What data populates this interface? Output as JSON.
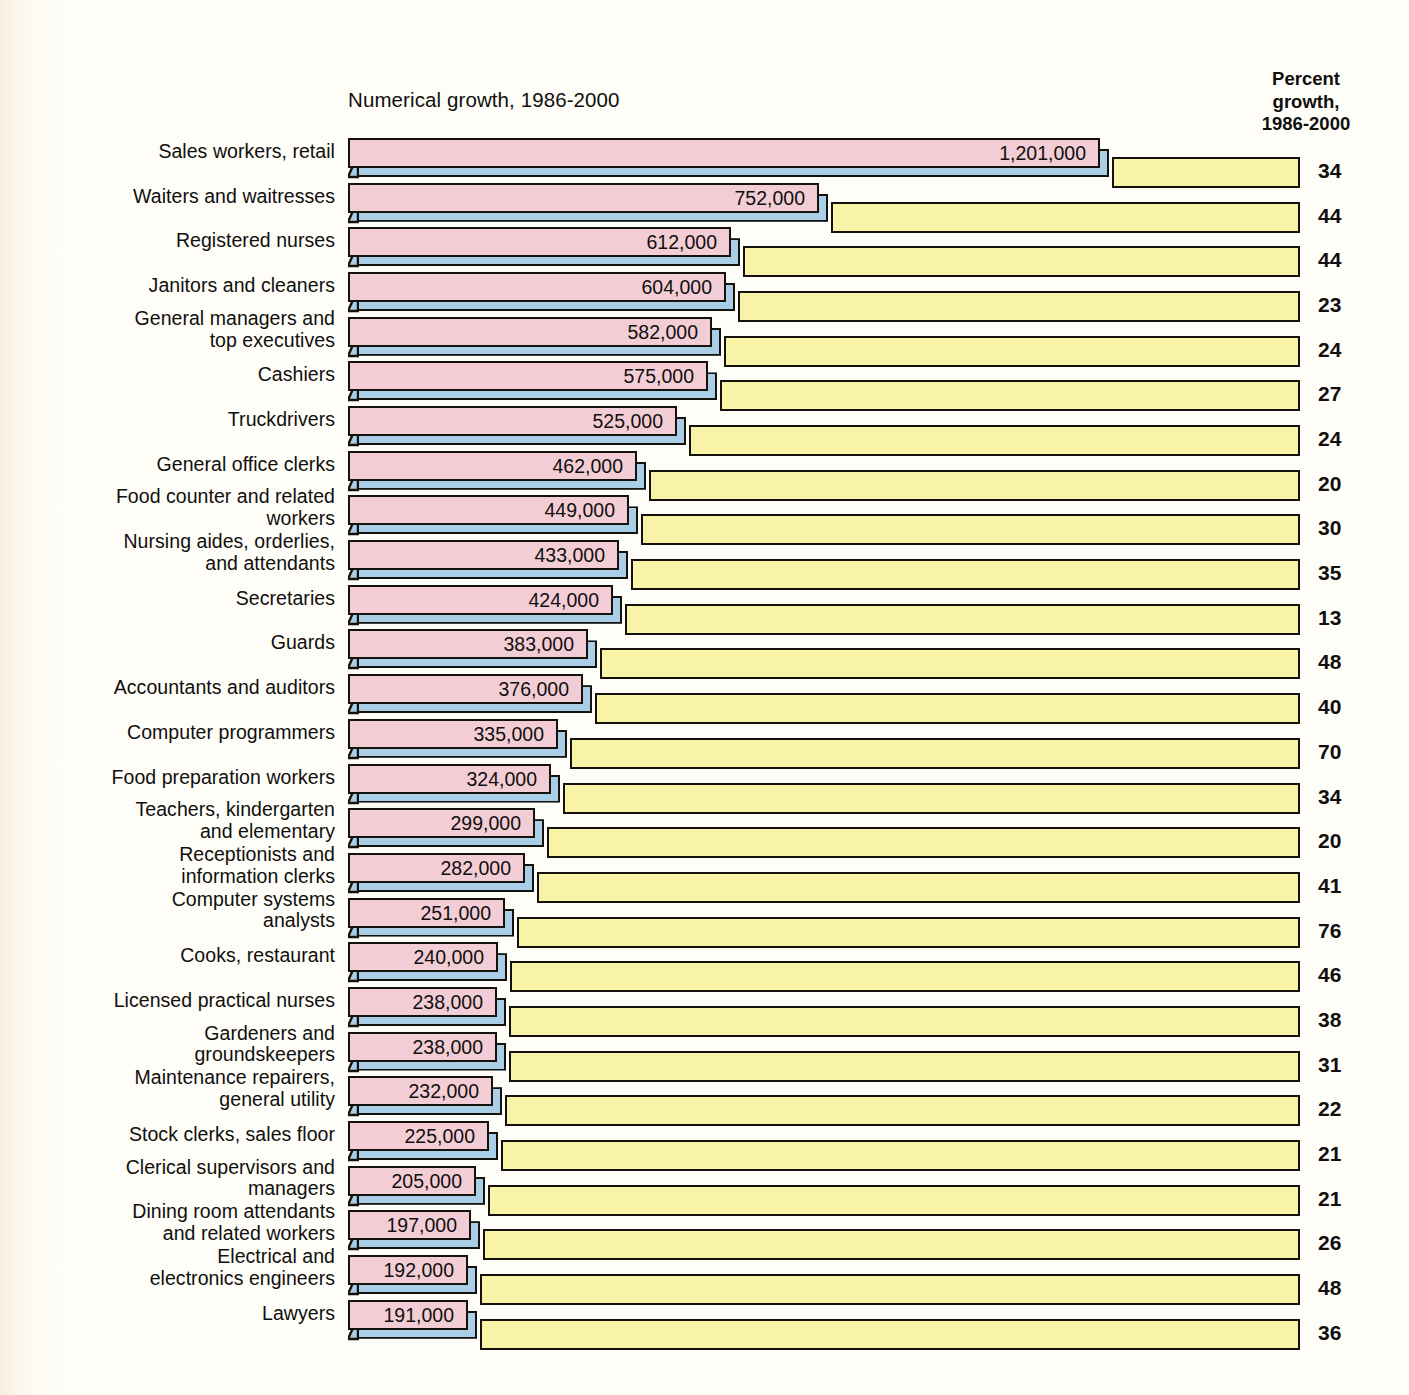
{
  "headers": {
    "left_title": "Numerical growth, 1986-2000",
    "right_title_line1": "Percent",
    "right_title_line2": "growth,",
    "right_title_line3": "1986-2000"
  },
  "colors": {
    "bar_face": "#f3cdd6",
    "bar_side": "#aacde8",
    "percent_bar": "#f9f3a8",
    "outline": "#15120c",
    "background": "#fefdf8",
    "text": "#100f0d"
  },
  "chart_data": {
    "type": "bar",
    "title": "Numerical growth, 1986-2000",
    "xlabel": "",
    "ylabel": "",
    "grid": false,
    "legend": "none",
    "series": [
      {
        "name": "Numerical growth, 1986-2000",
        "unit": "jobs"
      },
      {
        "name": "Percent growth, 1986-2000",
        "unit": "percent"
      }
    ],
    "categories": [
      "Sales workers, retail",
      "Waiters and waitresses",
      "Registered nurses",
      "Janitors and cleaners",
      "General managers and top executives",
      "Cashiers",
      "Truckdrivers",
      "General office clerks",
      "Food counter and related workers",
      "Nursing aides, orderlies, and attendants",
      "Secretaries",
      "Guards",
      "Accountants and auditors",
      "Computer programmers",
      "Food preparation workers",
      "Teachers, kindergarten and elementary",
      "Receptionists and information clerks",
      "Computer systems analysts",
      "Cooks, restaurant",
      "Licensed practical nurses",
      "Gardeners and groundskeepers",
      "Maintenance repairers, general utility",
      "Stock clerks, sales floor",
      "Clerical supervisors and managers",
      "Dining room attendants and related workers",
      "Electrical and electronics engineers",
      "Lawyers"
    ],
    "numerical_values": [
      1201000,
      752000,
      612000,
      604000,
      582000,
      575000,
      525000,
      462000,
      449000,
      433000,
      424000,
      383000,
      376000,
      335000,
      324000,
      299000,
      282000,
      251000,
      240000,
      238000,
      238000,
      232000,
      225000,
      205000,
      197000,
      192000,
      191000
    ],
    "percent_values": [
      34,
      44,
      44,
      23,
      24,
      27,
      24,
      20,
      30,
      35,
      13,
      48,
      40,
      70,
      34,
      20,
      41,
      76,
      46,
      38,
      31,
      22,
      21,
      21,
      26,
      48,
      36
    ]
  },
  "rows": [
    {
      "label_lines": [
        "Sales workers, retail"
      ],
      "value_text": "1,201,000",
      "value": 1201000,
      "percent_text": "34"
    },
    {
      "label_lines": [
        "Waiters and waitresses"
      ],
      "value_text": "752,000",
      "value": 752000,
      "percent_text": "44"
    },
    {
      "label_lines": [
        "Registered nurses"
      ],
      "value_text": "612,000",
      "value": 612000,
      "percent_text": "44"
    },
    {
      "label_lines": [
        "Janitors and cleaners"
      ],
      "value_text": "604,000",
      "value": 604000,
      "percent_text": "23"
    },
    {
      "label_lines": [
        "General managers and",
        "top executives"
      ],
      "value_text": "582,000",
      "value": 582000,
      "percent_text": "24"
    },
    {
      "label_lines": [
        "Cashiers"
      ],
      "value_text": "575,000",
      "value": 575000,
      "percent_text": "27"
    },
    {
      "label_lines": [
        "Truckdrivers"
      ],
      "value_text": "525,000",
      "value": 525000,
      "percent_text": "24"
    },
    {
      "label_lines": [
        "General office clerks"
      ],
      "value_text": "462,000",
      "value": 462000,
      "percent_text": "20"
    },
    {
      "label_lines": [
        "Food counter and related",
        "workers"
      ],
      "value_text": "449,000",
      "value": 449000,
      "percent_text": "30"
    },
    {
      "label_lines": [
        "Nursing aides, orderlies,",
        "and attendants"
      ],
      "value_text": "433,000",
      "value": 433000,
      "percent_text": "35"
    },
    {
      "label_lines": [
        "Secretaries"
      ],
      "value_text": "424,000",
      "value": 424000,
      "percent_text": "13"
    },
    {
      "label_lines": [
        "Guards"
      ],
      "value_text": "383,000",
      "value": 383000,
      "percent_text": "48"
    },
    {
      "label_lines": [
        "Accountants and auditors"
      ],
      "value_text": "376,000",
      "value": 376000,
      "percent_text": "40"
    },
    {
      "label_lines": [
        "Computer programmers"
      ],
      "value_text": "335,000",
      "value": 335000,
      "percent_text": "70"
    },
    {
      "label_lines": [
        "Food preparation workers"
      ],
      "value_text": "324,000",
      "value": 324000,
      "percent_text": "34"
    },
    {
      "label_lines": [
        "Teachers, kindergarten",
        "and elementary"
      ],
      "value_text": "299,000",
      "value": 299000,
      "percent_text": "20"
    },
    {
      "label_lines": [
        "Receptionists and",
        "information clerks"
      ],
      "value_text": "282,000",
      "value": 282000,
      "percent_text": "41"
    },
    {
      "label_lines": [
        "Computer systems",
        "analysts"
      ],
      "value_text": "251,000",
      "value": 251000,
      "percent_text": "76"
    },
    {
      "label_lines": [
        "Cooks, restaurant"
      ],
      "value_text": "240,000",
      "value": 240000,
      "percent_text": "46"
    },
    {
      "label_lines": [
        "Licensed practical nurses"
      ],
      "value_text": "238,000",
      "value": 238000,
      "percent_text": "38"
    },
    {
      "label_lines": [
        "Gardeners and",
        "groundskeepers"
      ],
      "value_text": "238,000",
      "value": 238000,
      "percent_text": "31"
    },
    {
      "label_lines": [
        "Maintenance repairers,",
        "general utility"
      ],
      "value_text": "232,000",
      "value": 232000,
      "percent_text": "22"
    },
    {
      "label_lines": [
        "Stock clerks, sales floor"
      ],
      "value_text": "225,000",
      "value": 225000,
      "percent_text": "21"
    },
    {
      "label_lines": [
        "Clerical supervisors and",
        "managers"
      ],
      "value_text": "205,000",
      "value": 205000,
      "percent_text": "21"
    },
    {
      "label_lines": [
        "Dining room attendants",
        "and related workers"
      ],
      "value_text": "197,000",
      "value": 197000,
      "percent_text": "26"
    },
    {
      "label_lines": [
        "Electrical and",
        "electronics engineers"
      ],
      "value_text": "192,000",
      "value": 192000,
      "percent_text": "48"
    },
    {
      "label_lines": [
        "Lawyers"
      ],
      "value_text": "191,000",
      "value": 191000,
      "percent_text": "36"
    }
  ]
}
